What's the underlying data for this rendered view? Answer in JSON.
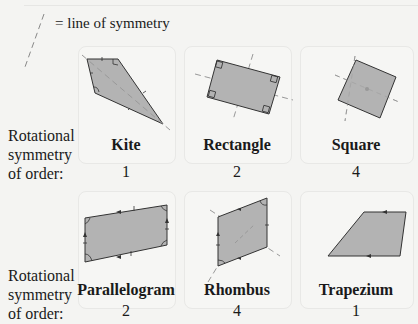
{
  "legend": {
    "text": "= line of symmetry",
    "icon": "dashed-line-icon"
  },
  "row_label": {
    "line1": "Rotational",
    "line2": "symmetry",
    "line3": "of order:"
  },
  "colors": {
    "fill": "#b3b3b3",
    "stroke": "#333333",
    "symmetry_line": "#999999",
    "card_border": "#e8e8e6",
    "background": "#f4f4f2"
  },
  "shapes": [
    {
      "name": "Kite",
      "order": "1"
    },
    {
      "name": "Rectangle",
      "order": "2"
    },
    {
      "name": "Square",
      "order": "4"
    },
    {
      "name": "Parallelogram",
      "order": "2"
    },
    {
      "name": "Rhombus",
      "order": "4"
    },
    {
      "name": "Trapezium",
      "order": "1"
    }
  ]
}
